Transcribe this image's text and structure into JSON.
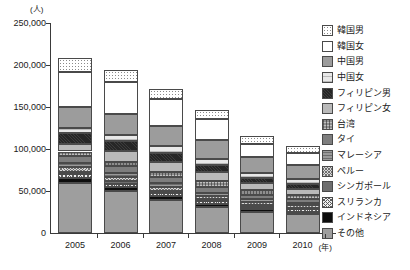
{
  "chart_data": {
    "type": "bar",
    "stacked": true,
    "title": "",
    "subtitle": "",
    "xlabel": "(年)",
    "ylabel": "(人)",
    "grid": false,
    "legend_position": "right",
    "categories": [
      "2005",
      "2006",
      "2007",
      "2008",
      "2009",
      "2010"
    ],
    "ylim": [
      0,
      250000
    ],
    "yticks": [
      {
        "value": 250000,
        "label": "250,000"
      },
      {
        "value": 200000,
        "label": "200,000"
      },
      {
        "value": 150000,
        "label": "150,000"
      },
      {
        "value": 100000,
        "label": "100,000"
      },
      {
        "value": 50000,
        "label": "50,000"
      },
      {
        "value": 0,
        "label": "0"
      }
    ],
    "totals": [
      208000,
      194000,
      172000,
      147000,
      115000,
      104000
    ],
    "series": [
      {
        "name": "韓国男",
        "key": "kr-m",
        "values": [
          16500,
          14500,
          13000,
          11500,
          9000,
          8500
        ]
      },
      {
        "name": "韓国女",
        "key": "kr-f",
        "values": [
          42000,
          38000,
          32000,
          25000,
          16000,
          14000
        ]
      },
      {
        "name": "中国男",
        "key": "cn-m",
        "values": [
          25000,
          25000,
          24000,
          22000,
          18000,
          17000
        ]
      },
      {
        "name": "中国女",
        "key": "cn-f",
        "values": [
          6000,
          7000,
          8000,
          8000,
          6500,
          6000
        ]
      },
      {
        "name": "フィリピン男",
        "key": "ph-m",
        "values": [
          12500,
          11500,
          10000,
          8000,
          6500,
          6000
        ]
      },
      {
        "name": "フィリピン女",
        "key": "ph-f",
        "values": [
          9000,
          13000,
          12000,
          11000,
          8000,
          7000
        ]
      },
      {
        "name": "台湾",
        "key": "tw",
        "values": [
          5000,
          5500,
          6000,
          6500,
          5500,
          5000
        ]
      },
      {
        "name": "タイ",
        "key": "th",
        "values": [
          9000,
          8500,
          8000,
          7000,
          5500,
          5000
        ]
      },
      {
        "name": "マレーシア",
        "key": "my",
        "values": [
          4500,
          4500,
          4000,
          3500,
          3000,
          2500
        ]
      },
      {
        "name": "ペルー",
        "key": "pe",
        "values": [
          5500,
          5000,
          4500,
          4000,
          3500,
          3000
        ]
      },
      {
        "name": "シンガポール",
        "key": "sg",
        "values": [
          3000,
          3000,
          2500,
          2500,
          2000,
          2000
        ]
      },
      {
        "name": "スリランカ",
        "key": "lk",
        "values": [
          4500,
          4000,
          4000,
          3500,
          3000,
          2500
        ]
      },
      {
        "name": "インドネシア",
        "key": "id",
        "values": [
          5500,
          5000,
          4500,
          4000,
          3000,
          2500
        ]
      },
      {
        "name": "その他",
        "key": "ot",
        "values": [
          60000,
          49500,
          39500,
          30500,
          25500,
          23000
        ]
      }
    ]
  }
}
